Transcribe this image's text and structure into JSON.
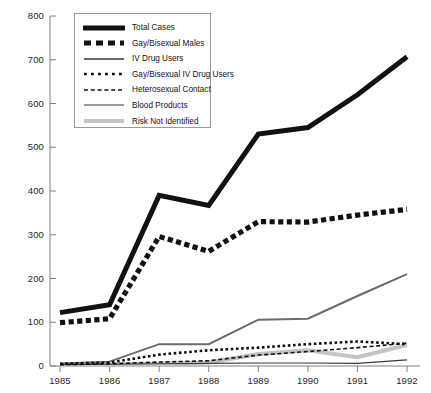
{
  "chart_data": {
    "type": "line",
    "title": "",
    "subtitle": "",
    "xlabel": "",
    "ylabel": "",
    "x": [
      1985,
      1986,
      1987,
      1988,
      1989,
      1990,
      1991,
      1992
    ],
    "categories": [
      "1985",
      "1986",
      "1987",
      "1988",
      "1989",
      "1990",
      "1991",
      "1992"
    ],
    "xlim": [
      1985,
      1992
    ],
    "ylim": [
      0,
      800
    ],
    "yticks": [
      0,
      100,
      200,
      300,
      400,
      500,
      600,
      700,
      800
    ],
    "ytick_labels": [
      "0",
      "100",
      "200",
      "300",
      "400",
      "500",
      "600",
      "700",
      "800"
    ],
    "xticks": [
      1985,
      1986,
      1987,
      1988,
      1989,
      1990,
      1991,
      1992
    ],
    "xtick_labels": [
      "1985",
      "1986",
      "1987",
      "1988",
      "1989",
      "1990",
      "1991",
      "1992"
    ],
    "grid": false,
    "legend_position": "upper-left",
    "series": [
      {
        "name": "Total Cases",
        "style": "thick-solid",
        "color": "#111111",
        "values": [
          122,
          140,
          390,
          367,
          530,
          545,
          620,
          707
        ]
      },
      {
        "name": "Gay/Bisexual Males",
        "style": "thick-dashed",
        "color": "#111111",
        "values": [
          99,
          108,
          296,
          262,
          330,
          329,
          345,
          358
        ]
      },
      {
        "name": "IV Drug Users",
        "style": "medium-solid-gray",
        "color": "#6b6b6b",
        "values": [
          6,
          10,
          50,
          50,
          106,
          108,
          160,
          210
        ]
      },
      {
        "name": "Gay/Bisexual IV Drug Users",
        "style": "dotted",
        "color": "#111111",
        "values": [
          5,
          8,
          26,
          36,
          42,
          50,
          56,
          50
        ]
      },
      {
        "name": "Heterosexual Contact",
        "style": "dashed",
        "color": "#111111",
        "values": [
          3,
          5,
          9,
          12,
          25,
          33,
          42,
          52
        ]
      },
      {
        "name": "Blood Products",
        "style": "thin-solid",
        "color": "#3a3a3a",
        "values": [
          3,
          4,
          5,
          6,
          7,
          7,
          6,
          14
        ]
      },
      {
        "name": "Risk Not Identified",
        "style": "thick-light-gray",
        "color": "#c4c4c4",
        "values": [
          2,
          3,
          5,
          8,
          27,
          36,
          20,
          48
        ]
      }
    ]
  },
  "legend": {
    "items": [
      {
        "label": "Total Cases"
      },
      {
        "label": "Gay/Bisexual Males"
      },
      {
        "label": "IV Drug Users"
      },
      {
        "label": "Gay/Bisexual IV Drug Users"
      },
      {
        "label": "Heterosexual Contact"
      },
      {
        "label": "Blood Products"
      },
      {
        "label": "Risk Not Identified"
      }
    ]
  },
  "axis": {
    "color": "#808080"
  }
}
